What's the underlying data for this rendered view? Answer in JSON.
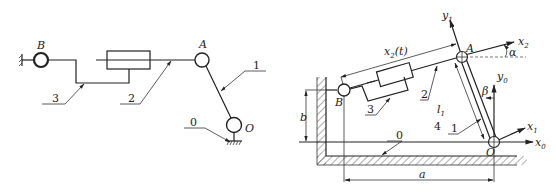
{
  "left_diagram": {
    "joints": {
      "B": "B",
      "A": "A",
      "O": "O"
    },
    "links": {
      "link0": "0",
      "link1": "1",
      "link2": "2",
      "link3": "3"
    }
  },
  "right_diagram": {
    "joints": {
      "A": "A",
      "B": "B",
      "O": "O"
    },
    "links": {
      "link0": "0",
      "link1": "1",
      "link2": "2",
      "link3": "3",
      "link4": "4"
    },
    "axes": {
      "y1": "y",
      "y1_sub": "1",
      "x2": "x",
      "x2_sub": "2",
      "y0": "y",
      "y0_sub": "0",
      "x1": "x",
      "x1_sub": "1",
      "x0": "x",
      "x0_sub": "0"
    },
    "dimensions": {
      "x2t": "x",
      "x2t_sub": "2",
      "x2t_arg": "(t)",
      "l1": "l",
      "l1_sub": "1",
      "b": "b",
      "a": "a"
    },
    "angles": {
      "alpha": "α",
      "beta": "β"
    }
  }
}
